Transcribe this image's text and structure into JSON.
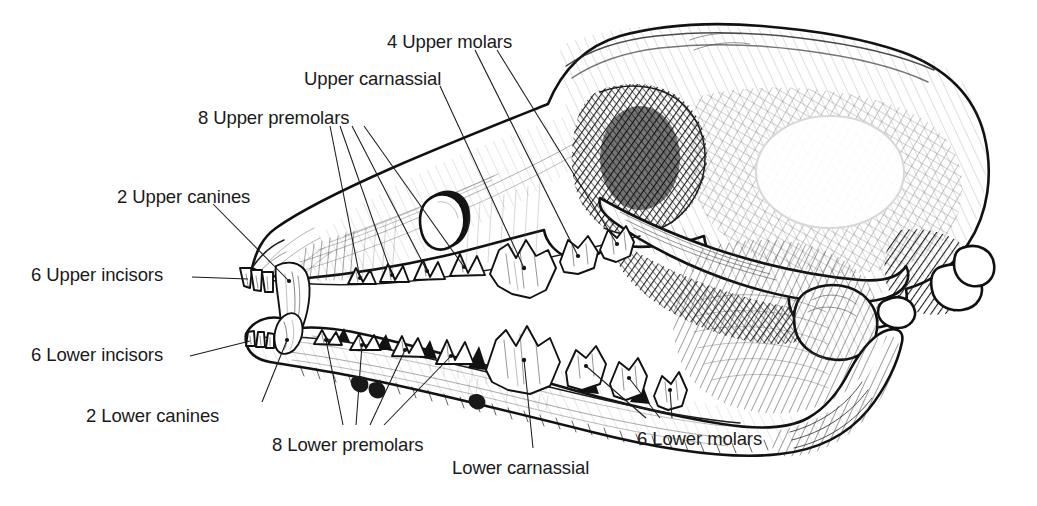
{
  "figure": {
    "background_color": "#ffffff",
    "ink_color": "#111111",
    "style": "pen-and-ink line engraving"
  },
  "labels": [
    {
      "id": "upper-molars",
      "text": "4 Upper molars",
      "x": 387,
      "y": 33,
      "align": "left",
      "leaders": 2
    },
    {
      "id": "upper-carnassial",
      "text": "Upper carnassial",
      "x": 304,
      "y": 70,
      "align": "left",
      "leaders": 1
    },
    {
      "id": "upper-premolars",
      "text": "8 Upper premolars",
      "x": 198,
      "y": 109,
      "align": "left",
      "leaders": 4
    },
    {
      "id": "upper-canines",
      "text": "2 Upper canines",
      "x": 117,
      "y": 188,
      "align": "left",
      "leaders": 1
    },
    {
      "id": "upper-incisors",
      "text": "6 Upper incisors",
      "x": 31,
      "y": 266,
      "align": "left",
      "leaders": 1
    },
    {
      "id": "lower-incisors",
      "text": "6 Lower incisors",
      "x": 31,
      "y": 346,
      "align": "left",
      "leaders": 1
    },
    {
      "id": "lower-canines",
      "text": "2 Lower canines",
      "x": 86,
      "y": 407,
      "align": "left",
      "leaders": 1
    },
    {
      "id": "lower-premolars",
      "text": "8 Lower premolars",
      "x": 272,
      "y": 436,
      "align": "left",
      "leaders": 4
    },
    {
      "id": "lower-carnassial",
      "text": "Lower carnassial",
      "x": 452,
      "y": 459,
      "align": "left",
      "leaders": 1
    },
    {
      "id": "lower-molars",
      "text": "6 Lower molars",
      "x": 637,
      "y": 430,
      "align": "left",
      "leaders": 3
    }
  ],
  "dentition": {
    "upper_incisors": 6,
    "upper_canines": 2,
    "upper_premolars": 8,
    "upper_molars": 4,
    "upper_carnassial": 1,
    "lower_incisors": 6,
    "lower_canines": 2,
    "lower_premolars": 8,
    "lower_molars": 6,
    "lower_carnassial": 1,
    "total_teeth": 42
  }
}
